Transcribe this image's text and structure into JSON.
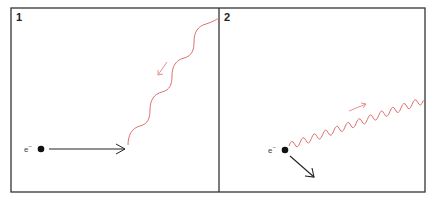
{
  "figure": {
    "type": "compton-scattering-diagram",
    "colors": {
      "frame": "#333333",
      "electron": "#111111",
      "photon": "#e07070",
      "photon_arrow": "#e89090",
      "background": "#ffffff"
    },
    "panels": [
      {
        "number": "1",
        "electron_label": "e",
        "electron_charge": "−",
        "description": "incoming photon toward electron moving right"
      },
      {
        "number": "2",
        "electron_label": "e",
        "electron_charge": "−",
        "description": "scattered photon with longer wavelength; electron recoils down-right"
      }
    ]
  }
}
